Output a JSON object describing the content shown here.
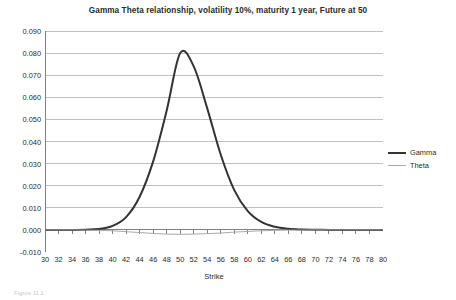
{
  "chart_data": {
    "type": "line",
    "title": "Gamma Theta relationship, volatility 10%, maturity 1 year, Future at 50",
    "xlabel": "Strike",
    "ylabel": "",
    "categories": [
      30,
      32,
      34,
      36,
      38,
      40,
      42,
      44,
      46,
      48,
      50,
      52,
      54,
      56,
      58,
      60,
      62,
      64,
      66,
      68,
      70,
      72,
      74,
      76,
      78,
      80
    ],
    "x": [
      30,
      32,
      34,
      36,
      38,
      40,
      42,
      44,
      46,
      48,
      50,
      52,
      54,
      56,
      58,
      60,
      62,
      64,
      66,
      68,
      70,
      72,
      74,
      76,
      78,
      80
    ],
    "xlim": [
      30,
      80
    ],
    "ylim": [
      -0.01,
      0.09
    ],
    "yticks": [
      0.09,
      0.08,
      0.07,
      0.06,
      0.05,
      0.04,
      0.03,
      0.02,
      0.01,
      0.0,
      -0.01
    ],
    "ytick_labels": [
      "0.090",
      "0.080",
      "0.070",
      "0.060",
      "0.050",
      "0.040",
      "0.030",
      "0.020",
      "0.010",
      "0.000",
      "-0.010"
    ],
    "xtick_labels": [
      "30",
      "32",
      "34",
      "36",
      "38",
      "40",
      "42",
      "44",
      "46",
      "48",
      "50",
      "52",
      "54",
      "56",
      "58",
      "60",
      "62",
      "64",
      "66",
      "68",
      "70",
      "72",
      "74",
      "76",
      "78",
      "80"
    ],
    "grid": true,
    "grid_axis": "y",
    "legend_position": "right",
    "series": [
      {
        "name": "Gamma",
        "color": "#333333",
        "width": 2.0,
        "values": [
          0.0,
          0.0,
          0.0,
          0.0001,
          0.0004,
          0.0018,
          0.0058,
          0.015,
          0.031,
          0.054,
          0.08,
          0.074,
          0.055,
          0.034,
          0.018,
          0.0085,
          0.0036,
          0.0014,
          0.0005,
          0.0002,
          0.0001,
          0.0,
          0.0,
          0.0,
          0.0,
          0.0
        ]
      },
      {
        "name": "Theta",
        "color": "#aaaaaa",
        "width": 1.0,
        "values": [
          0.0,
          0.0,
          0.0,
          -0.0001,
          -0.0002,
          -0.0004,
          -0.0008,
          -0.0012,
          -0.0016,
          -0.0019,
          -0.002,
          -0.0019,
          -0.0017,
          -0.0014,
          -0.001,
          -0.0007,
          -0.0004,
          -0.0002,
          -0.0001,
          -0.0001,
          0.0,
          0.0,
          0.0,
          0.0,
          0.0,
          0.0
        ]
      }
    ]
  },
  "chart": {
    "title": "Gamma Theta relationship, volatility 10%, maturity 1 year, Future at 50",
    "x_axis_title": "Strike"
  },
  "legend": {
    "items": [
      {
        "label": "Gamma"
      },
      {
        "label": "Theta"
      }
    ]
  },
  "colors": {
    "gamma": "#333333",
    "theta": "#aaaaaa",
    "grid": "#bfbfbf",
    "axis": "#808080",
    "text": "#2b2b2b",
    "background": "#ffffff"
  },
  "footer": {
    "note": "Figure 11.1"
  }
}
